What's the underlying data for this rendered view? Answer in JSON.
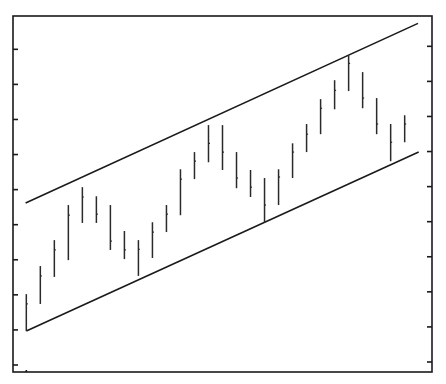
{
  "chart_data": {
    "type": "bar",
    "subtype": "ohlc-hlc",
    "title": "",
    "xlabel": "",
    "ylabel": "",
    "ylim": [
      -0.2,
      9.95
    ],
    "xlim": [
      0.05,
      29.95
    ],
    "yticks": [
      0,
      1,
      2,
      3,
      4,
      5,
      6,
      7,
      8,
      9
    ],
    "ytick_labels": [],
    "grid": false,
    "legend": "none",
    "bars": [
      {
        "x": 1,
        "high": 2.02,
        "low": 0.97,
        "close": 1.74
      },
      {
        "x": 2,
        "high": 2.82,
        "low": 1.74,
        "close": 2.54
      },
      {
        "x": 3,
        "high": 3.56,
        "low": 2.51,
        "close": 3.28
      },
      {
        "x": 4,
        "high": 4.56,
        "low": 2.99,
        "close": 4.27
      },
      {
        "x": 5,
        "high": 5.07,
        "low": 4.05,
        "close": 4.79
      },
      {
        "x": 6,
        "high": 4.81,
        "low": 4.05,
        "close": 4.3
      },
      {
        "x": 7,
        "high": 4.56,
        "low": 3.28,
        "close": 3.53
      },
      {
        "x": 8,
        "high": 3.82,
        "low": 3.02,
        "close": 3.28
      },
      {
        "x": 9,
        "high": 3.56,
        "low": 2.54,
        "close": 3.3
      },
      {
        "x": 10,
        "high": 4.07,
        "low": 3.05,
        "close": 3.79
      },
      {
        "x": 11,
        "high": 4.56,
        "low": 3.79,
        "close": 4.3
      },
      {
        "x": 12,
        "high": 5.58,
        "low": 4.27,
        "close": 5.3
      },
      {
        "x": 13,
        "high": 6.07,
        "low": 5.3,
        "close": 5.81
      },
      {
        "x": 14,
        "high": 6.84,
        "low": 5.78,
        "close": 6.32
      },
      {
        "x": 15,
        "high": 6.84,
        "low": 5.56,
        "close": 6.07
      },
      {
        "x": 16,
        "high": 6.07,
        "low": 5.04,
        "close": 5.33
      },
      {
        "x": 17,
        "high": 5.56,
        "low": 4.79,
        "close": 5.07
      },
      {
        "x": 18,
        "high": 5.33,
        "low": 4.05,
        "close": 4.56
      },
      {
        "x": 19,
        "high": 5.58,
        "low": 4.56,
        "close": 5.36
      },
      {
        "x": 20,
        "high": 6.32,
        "low": 5.33,
        "close": 6.07
      },
      {
        "x": 21,
        "high": 6.87,
        "low": 6.07,
        "close": 6.58
      },
      {
        "x": 22,
        "high": 7.58,
        "low": 6.58,
        "close": 7.32
      },
      {
        "x": 23,
        "high": 8.12,
        "low": 7.29,
        "close": 7.83
      },
      {
        "x": 24,
        "high": 8.83,
        "low": 7.81,
        "close": 8.6
      },
      {
        "x": 25,
        "high": 8.35,
        "low": 7.32,
        "close": 7.61
      },
      {
        "x": 26,
        "high": 7.61,
        "low": 6.58,
        "close": 6.87
      },
      {
        "x": 27,
        "high": 6.87,
        "low": 5.81,
        "close": 6.35
      },
      {
        "x": 28,
        "high": 7.12,
        "low": 6.35,
        "close": 6.87
      }
    ],
    "trend_lines": [
      {
        "name": "upper-channel",
        "x": [
          0.95,
          28.95
        ],
        "y": [
          4.62,
          9.74
        ]
      },
      {
        "name": "lower-channel",
        "x": [
          1.0,
          29.0
        ],
        "y": [
          0.97,
          6.07
        ]
      }
    ]
  }
}
